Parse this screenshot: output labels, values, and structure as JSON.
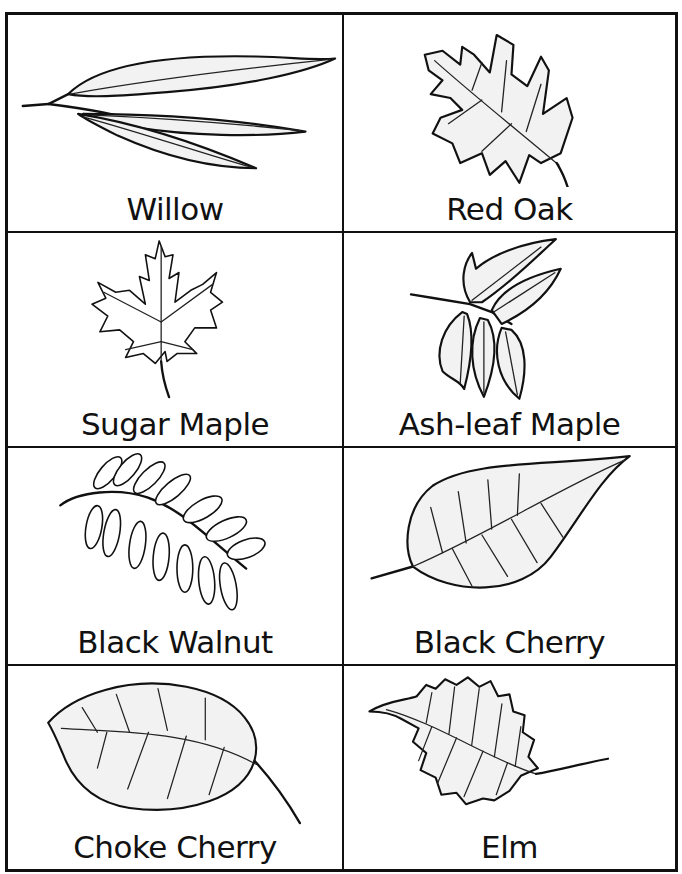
{
  "worksheet": {
    "title": "Leaf Identification Cards",
    "cards": [
      {
        "label": "Willow",
        "icon": "willow-leaf-illustration"
      },
      {
        "label": "Red Oak",
        "icon": "red-oak-leaf-illustration"
      },
      {
        "label": "Sugar Maple",
        "icon": "sugar-maple-leaf-illustration"
      },
      {
        "label": "Ash-leaf Maple",
        "icon": "ash-leaf-maple-leaf-illustration"
      },
      {
        "label": "Black Walnut",
        "icon": "black-walnut-leaf-illustration"
      },
      {
        "label": "Black Cherry",
        "icon": "black-cherry-leaf-illustration"
      },
      {
        "label": "Choke Cherry",
        "icon": "choke-cherry-leaf-illustration"
      },
      {
        "label": "Elm",
        "icon": "elm-leaf-illustration"
      }
    ]
  },
  "colors": {
    "ink": "#111111",
    "paper": "#ffffff",
    "stipple": "#f2f2f2"
  }
}
